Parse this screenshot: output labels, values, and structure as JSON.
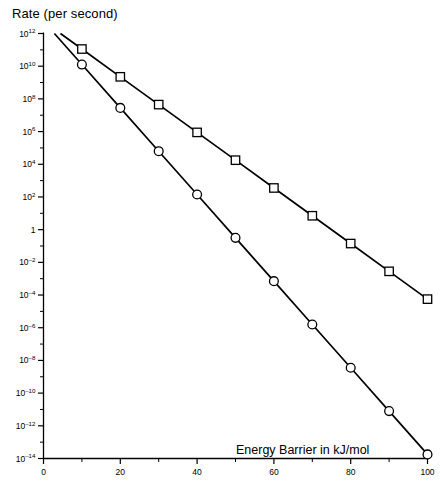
{
  "chart_data": {
    "type": "line",
    "title": "Rate (per second)",
    "xlabel": "Energy Barrier in kJ/mol",
    "ylabel": "Rate (per second)",
    "xlim": [
      0,
      100
    ],
    "ylim": [
      1e-14,
      1000000000000.0
    ],
    "yscale": "log",
    "xscale": "linear",
    "grid": false,
    "legend": "none",
    "x": [
      10,
      20,
      30,
      40,
      50,
      60,
      70,
      80,
      90,
      100
    ],
    "xticks": [
      0,
      20,
      40,
      60,
      80,
      100
    ],
    "xtick_labels": [
      "0",
      "20",
      "40",
      "60",
      "80",
      "100"
    ],
    "xticks_minor": [
      10,
      30,
      50,
      70,
      90
    ],
    "ytick_exponents": [
      12,
      10,
      8,
      6,
      4,
      2,
      0,
      -2,
      -4,
      -6,
      -8,
      -10,
      -12,
      -14
    ],
    "ytick_labels": [
      "10¹²",
      "10¹⁰",
      "10⁸",
      "10⁶",
      "10⁴",
      "10²",
      "1",
      "10⁻²",
      "10⁻⁴",
      "10⁻⁶",
      "10⁻⁸",
      "10⁻¹⁰",
      "10⁻¹²",
      "10⁻¹⁴"
    ],
    "series": [
      {
        "name": "upper-series",
        "marker": "square",
        "log_values": [
          11.05,
          9.35,
          7.65,
          5.95,
          4.25,
          2.55,
          0.85,
          -0.85,
          -2.55,
          -4.25
        ],
        "values": [
          110000000000.0,
          2200000000.0,
          45000000.0,
          890000.0,
          18000.0,
          350.0,
          7.1,
          0.14,
          0.0028,
          5.6e-05
        ]
      },
      {
        "name": "lower-series",
        "marker": "circle",
        "log_values": [
          10.1,
          7.45,
          4.8,
          2.15,
          -0.5,
          -3.15,
          -5.8,
          -8.45,
          -11.1,
          -13.75
        ],
        "values": [
          13000000000.0,
          28000000.0,
          63000.0,
          140.0,
          0.32,
          0.00071,
          1.6e-06,
          3.5e-09,
          7.9e-12,
          1.8e-14
        ]
      }
    ]
  },
  "colors": {
    "axis": "#000000",
    "line": "#000000",
    "marker_fill": "#ffffff",
    "background": "#ffffff"
  }
}
